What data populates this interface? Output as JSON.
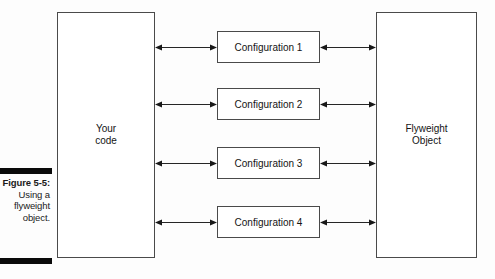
{
  "figure": {
    "caption": {
      "figure_number": "Figure 5-5:",
      "line_1": "Using a",
      "line_2": "flyweight",
      "line_3": "object."
    },
    "left_node": {
      "label": "Your\ncode"
    },
    "right_node": {
      "label": "Flyweight\nObject"
    },
    "middle_nodes": [
      {
        "label": "Configuration 1"
      },
      {
        "label": "Configuration 2"
      },
      {
        "label": "Configuration 3"
      },
      {
        "label": "Configuration 4"
      }
    ],
    "connectors": {
      "arrow_style": "double-headed",
      "count": 8
    },
    "colors": {
      "box_border": "#4a4a4a",
      "box_fill": "#ffffff",
      "text": "#141414",
      "caption_rule": "#0a0a0a",
      "arrow": "#262626",
      "page_background": "#fdfdfd"
    }
  }
}
